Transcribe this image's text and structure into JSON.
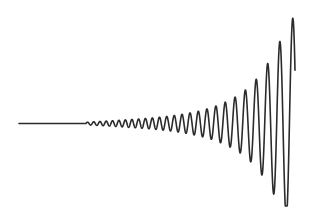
{
  "figure": {
    "title": "",
    "background_color": "#ffffff",
    "width": 313,
    "height": 208
  },
  "chart_data": {
    "type": "line",
    "title": "",
    "subtitle": "",
    "xlabel": "",
    "ylabel": "",
    "grid": false,
    "legend": null,
    "axes_visible": false,
    "tick_labels": [],
    "annotations": [],
    "series": [
      {
        "name": "growing-oscillation",
        "color": "#2b2b2b",
        "line_width": 1.6,
        "description": "Flat baseline that develops into a sinusoid whose amplitude grows exponentially toward the right while its wavelength slowly increases.",
        "model": {
          "baseline_y": 123.5,
          "x_start": 19,
          "x_end": 295,
          "x_oscillation_onset": 86,
          "amplitude_at_onset": 1.2,
          "amplitude_at_end": 109,
          "growth_type": "exponential",
          "growth_rate_per_px": 0.01645,
          "wavelength_start_px": 6.2,
          "wavelength_end_px": 13.5,
          "final_peak": {
            "x": 295,
            "y": 15
          },
          "deepest_trough": {
            "x": 289,
            "y": 197
          }
        },
        "x": [
          19,
          40,
          60,
          80,
          86,
          95,
          110,
          125,
          140,
          155,
          170,
          185,
          200,
          212,
          222,
          232,
          241,
          249,
          256,
          263,
          269,
          275,
          282,
          289,
          295
        ],
        "y_envelope": [
          0,
          0,
          0,
          0.4,
          1.2,
          1.8,
          2.6,
          3.6,
          4.6,
          5.8,
          7.4,
          9.6,
          12.6,
          16.0,
          19.8,
          24.5,
          30.0,
          36.5,
          44.0,
          53.0,
          62.0,
          73.0,
          86.0,
          99.0,
          109.0
        ]
      }
    ],
    "xlim": [
      0,
      313
    ],
    "ylim": [
      0,
      208
    ]
  },
  "colors": {
    "stroke": "#2b2b2b",
    "background": "#ffffff"
  }
}
